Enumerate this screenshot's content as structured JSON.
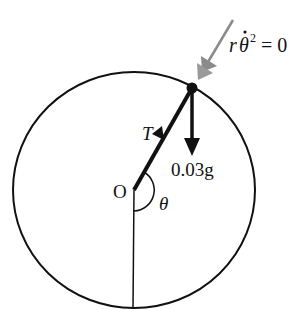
{
  "diagram": {
    "labels": {
      "origin": "O",
      "angle": "θ",
      "tension": "T",
      "weight": "0.03g",
      "radial_r": "r",
      "radial_theta": "θ",
      "radial_exp": "2",
      "radial_rhs": "= 0"
    },
    "colors": {
      "line": "#111111",
      "grey_arrow": "#8a8a8a",
      "background": "#ffffff"
    },
    "circle": {
      "cx": 134,
      "cy": 190,
      "rx": 121,
      "ry": 118
    },
    "particle": {
      "x": 192,
      "y": 88
    },
    "center": {
      "x": 134,
      "y": 190
    }
  }
}
